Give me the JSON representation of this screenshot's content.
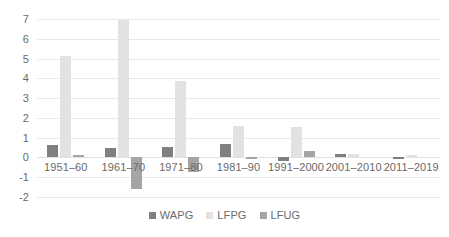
{
  "chart_data": {
    "type": "bar",
    "title": "",
    "subtitle": "",
    "xlabel": "",
    "ylabel": "",
    "ylim": [
      -2,
      7
    ],
    "y_ticks": [
      7,
      6,
      5,
      4,
      3,
      2,
      1,
      0,
      -1,
      -2
    ],
    "y_tick_labels": [
      "7",
      "6",
      "5",
      "4",
      "3",
      "2",
      "1",
      "0",
      "-1",
      "-2"
    ],
    "grid": true,
    "legend_position": "bottom",
    "categories": [
      "1951–60",
      "1961–70",
      "1971–80",
      "1981–90",
      "1991–2000",
      "2001–2010",
      "2011–2019"
    ],
    "series": [
      {
        "name": "WAPG",
        "color": "#7f7f7f",
        "values": [
          0.62,
          0.5,
          0.55,
          0.7,
          -0.18,
          0.15,
          -0.07
        ]
      },
      {
        "name": "LFPG",
        "color": "#e2e2e2",
        "values": [
          5.15,
          6.95,
          3.85,
          1.6,
          1.55,
          0.15,
          0.1
        ]
      },
      {
        "name": "LFUG",
        "color": "#a5a5a5",
        "values": [
          0.1,
          -1.6,
          -0.75,
          -0.07,
          0.35,
          0.0,
          0.0
        ]
      }
    ]
  },
  "legend": {
    "items": [
      {
        "label": "WAPG",
        "swatch": "wapg"
      },
      {
        "label": "LFPG",
        "swatch": "lfpg"
      },
      {
        "label": "LFUG",
        "swatch": "lfug"
      }
    ]
  }
}
